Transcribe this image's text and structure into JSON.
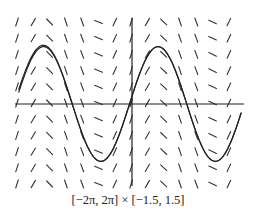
{
  "chart_data": {
    "type": "slope_field",
    "title": "",
    "caption": "[−2π, 2π] × [−1.5, 1.5]",
    "xlim": [
      -6.2832,
      6.2832
    ],
    "ylim": [
      -1.5,
      1.5
    ],
    "xlabel": "",
    "ylabel": "",
    "grid": false,
    "slope_field": {
      "description": "Direction field; slope depends only on x (dy/dx = cos x)",
      "columns": 14,
      "rows": 11
    },
    "solution_curves": [
      {
        "name": "y = sin x",
        "function": "sin(x)"
      },
      {
        "name": "y = sin x + 0.05",
        "function": "sin(x)+0.05"
      }
    ]
  },
  "colors": {
    "ink": "#222222",
    "background": "#ffffff"
  }
}
